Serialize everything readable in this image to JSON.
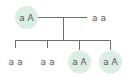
{
  "diagram": {
    "type": "pedigree",
    "colors": {
      "carrier_fill": "#dbede5",
      "line": "#6e6e6e",
      "text": "#555555"
    },
    "parents": [
      {
        "genotype": "a A",
        "highlighted": true
      },
      {
        "genotype": "a a",
        "highlighted": false
      }
    ],
    "children": [
      {
        "genotype": "a a",
        "highlighted": false
      },
      {
        "genotype": "a a",
        "highlighted": false
      },
      {
        "genotype": "a A",
        "highlighted": true
      },
      {
        "genotype": "a A",
        "highlighted": true
      }
    ]
  }
}
